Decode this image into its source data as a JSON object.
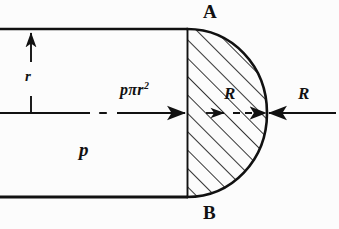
{
  "figure": {
    "type": "engineering-free-body-diagram",
    "background_color": "#fcfcfc",
    "ink_color": "#111111"
  },
  "labels": {
    "vertex_top": "A",
    "vertex_bottom": "B",
    "radius": "r",
    "pressure": "p",
    "pressure_force_base": "pπr",
    "pressure_force_exponent": "2",
    "pressure_force_full": "pπr²",
    "reaction_inner": "R",
    "reaction_outer": "R"
  },
  "geometry": {
    "top_wall_y": 29,
    "bottom_wall_y": 197,
    "centerline_y": 113,
    "chord_x": 187,
    "dome_apex_x": 267,
    "radius_dim_x": 31,
    "hatch_angle_deg": 45
  },
  "annotations": {
    "radius_arrow_direction": "up",
    "pressure_force_arrow_direction": "right",
    "reaction_inner_arrow_direction": "right",
    "reaction_outer_arrow_direction": "left",
    "centerline_style": "dash-dot",
    "reaction_inner_line_style": "dashed",
    "dome_fill": "diagonal-hatch"
  }
}
